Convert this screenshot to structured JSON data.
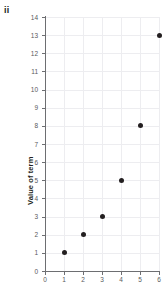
{
  "figure": {
    "part_label": "ii"
  },
  "chart_data": {
    "type": "scatter",
    "title": "",
    "xlabel": "",
    "ylabel": "Value of term",
    "xlim": [
      0,
      6
    ],
    "ylim": [
      0,
      14
    ],
    "xticks": [
      0,
      1,
      2,
      3,
      4,
      5,
      6
    ],
    "yticks": [
      0,
      1,
      2,
      3,
      4,
      5,
      6,
      7,
      8,
      9,
      10,
      11,
      12,
      13,
      14
    ],
    "xtick_labels": [
      "0",
      "1",
      "2",
      "3",
      "4",
      "5",
      "6"
    ],
    "ytick_labels": [
      "0",
      "1",
      "2",
      "3",
      "4",
      "5",
      "6",
      "7",
      "8",
      "9",
      "10",
      "11",
      "12",
      "13",
      "14"
    ],
    "grid": true,
    "legend": "none",
    "x": [
      1,
      2,
      3,
      4,
      5,
      6
    ],
    "y": [
      1,
      2,
      3,
      5,
      8,
      13
    ],
    "points": [
      {
        "x": 1,
        "y": 1
      },
      {
        "x": 2,
        "y": 2
      },
      {
        "x": 3,
        "y": 3
      },
      {
        "x": 4,
        "y": 5
      },
      {
        "x": 5,
        "y": 8
      },
      {
        "x": 6,
        "y": 13
      }
    ],
    "marker_color": "#231f20",
    "grid_color": "#ededf0",
    "axis_color": "#6d6e71",
    "tick_label_color": "#58595b"
  }
}
